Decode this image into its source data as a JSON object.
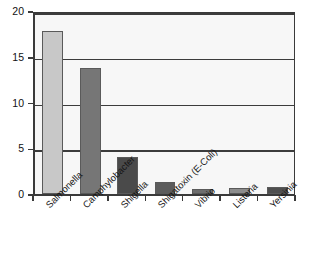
{
  "chart_data": {
    "type": "bar",
    "title": "",
    "subtitle": "",
    "xlabel": "",
    "ylabel": "",
    "categories": [
      "Salmonella",
      "Camphylobacter",
      "Shigella",
      "Shigatoxin (E-Coli)",
      "Vibrio",
      "Listeria",
      "Yersinia"
    ],
    "values": [
      17.8,
      13.8,
      4.1,
      1.3,
      0.6,
      0.7,
      0.8
    ],
    "bar_colors": [
      "#c8c8c8",
      "#767676",
      "#4a4a4a",
      "#5c5c5c",
      "#6e6e6e",
      "#8c8c8c",
      "#4f4f4f"
    ],
    "ylim": [
      0,
      20
    ],
    "yticks": [
      0,
      5,
      10,
      15,
      20
    ],
    "ytick_labels": [
      "0",
      "5",
      "10",
      "15",
      "20"
    ],
    "grid": true,
    "grid_axis": "y",
    "legend": false,
    "legend_position": "none",
    "plot_background": "#f7f7f7",
    "axis_color": "#3a3a3a",
    "label_rotation_deg": -45
  }
}
